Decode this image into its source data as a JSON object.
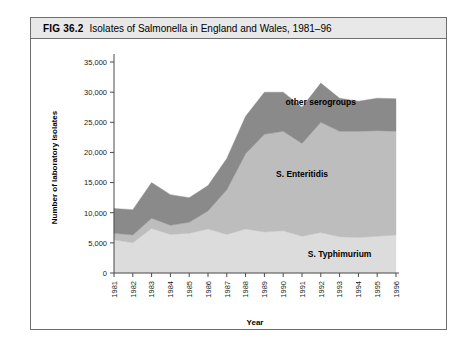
{
  "figure": {
    "number": "FIG 36.2",
    "title": "Isolates of Salmonella in England and Wales, 1981–96"
  },
  "chart_data": {
    "type": "area",
    "stacked": true,
    "title": "Isolates of Salmonella in England and Wales, 1981–96",
    "xlabel": "Year",
    "ylabel": "Number of laboratory isolates",
    "categories": [
      1981,
      1982,
      1983,
      1984,
      1985,
      1986,
      1987,
      1988,
      1989,
      1990,
      1991,
      1992,
      1993,
      1994,
      1995,
      1996
    ],
    "xtick_labels": [
      "1981",
      "1982",
      "1983",
      "1984",
      "1985",
      "1986",
      "1987",
      "1988",
      "1989",
      "1990",
      "1991",
      "1992",
      "1993",
      "1994",
      "1995",
      "1996"
    ],
    "ytick_labels": [
      "0",
      "5,000",
      "10,000",
      "15,000",
      "20,000",
      "25,000",
      "30,000",
      "35,000"
    ],
    "ytick_values": [
      0,
      5000,
      10000,
      15000,
      20000,
      25000,
      30000,
      35000
    ],
    "ylim": [
      0,
      35000
    ],
    "xlim": [
      1981,
      1996
    ],
    "grid": false,
    "legend_position": "inline-band-labels",
    "series": [
      {
        "name": "S. Typhimurium",
        "color": "#dcdcdc",
        "label_year": 1993,
        "label_value": 2600,
        "values": [
          5500,
          5000,
          7400,
          6400,
          6600,
          7300,
          6400,
          7300,
          6800,
          7000,
          6100,
          6700,
          6000,
          5900,
          6100,
          6300
        ]
      },
      {
        "name": "S. Enteritidis",
        "color": "#bdbdbd",
        "label_year": 1991,
        "label_value": 16000,
        "values": [
          1100,
          1300,
          1700,
          1500,
          1800,
          3000,
          7400,
          12500,
          16200,
          16500,
          15400,
          18300,
          17500,
          17600,
          17500,
          17200
        ]
      },
      {
        "name": "other serogroups",
        "color": "#8a8a8a",
        "label_year": 1992,
        "label_value": 27800,
        "values": [
          4100,
          4200,
          5900,
          5100,
          4100,
          4200,
          5200,
          6200,
          7000,
          6500,
          6000,
          6500,
          5500,
          5000,
          5400,
          5400
        ]
      }
    ],
    "totals": [
      10700,
      10500,
      15000,
      13000,
      12500,
      14500,
      19000,
      26000,
      30000,
      30000,
      27500,
      31500,
      29000,
      28500,
      29000,
      28900
    ]
  }
}
